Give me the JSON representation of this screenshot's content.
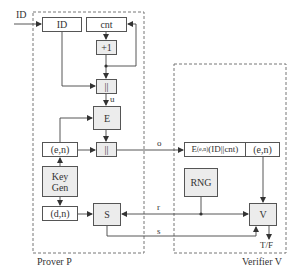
{
  "diagram": {
    "input_label": "ID",
    "prover": {
      "title": "Prover P",
      "boxes": {
        "id": "ID",
        "cnt": "cnt",
        "increment": "+1",
        "concat1": "||",
        "encrypt": "E",
        "public_key": "(e,n)",
        "concat2": "||",
        "keygen_line1": "Key",
        "keygen_line2": "Gen",
        "private_key": "(d,n)",
        "sign": "S"
      }
    },
    "verifier": {
      "title": "Verifier V",
      "boxes": {
        "stored_main": "E",
        "stored_sub": "(e,n)",
        "stored_rest": "(ID||cnt)",
        "stored_key": "(e,n)",
        "rng": "RNG",
        "verify": "V"
      }
    },
    "edge_labels": {
      "u": "u",
      "o": "o",
      "r": "r",
      "s": "s",
      "output": "T/F"
    }
  }
}
